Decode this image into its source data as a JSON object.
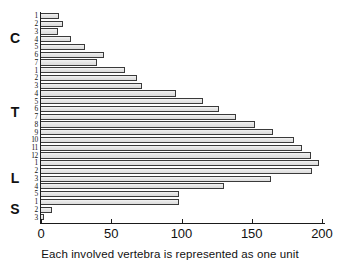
{
  "chart_data": {
    "type": "bar",
    "orientation": "horizontal",
    "title": "",
    "subtitle": "",
    "xlabel": "",
    "ylabel": "",
    "caption": "Each involved vertebra is represented as one unit",
    "xlim": [
      0,
      200
    ],
    "ylim": null,
    "grid": false,
    "legend": null,
    "xticks": [
      0,
      50,
      100,
      150,
      200
    ],
    "xtick_labels": [
      "0",
      "50",
      "100",
      "150",
      "200"
    ],
    "categories": [
      "C1",
      "C2",
      "C3",
      "C4",
      "C5",
      "C6",
      "C7",
      "T1",
      "T2",
      "T3",
      "T4",
      "T5",
      "T6",
      "T7",
      "T8",
      "T9",
      "T10",
      "T11",
      "T12",
      "L1",
      "L2",
      "L3",
      "L4",
      "L5",
      "S1",
      "S2",
      "S3"
    ],
    "tick_labels": [
      "1",
      "2",
      "3",
      "4",
      "5",
      "6",
      "7",
      "1",
      "2",
      "3",
      "4",
      "5",
      "6",
      "7",
      "8",
      "9",
      "10",
      "11",
      "12",
      "1",
      "2",
      "3",
      "4",
      "5",
      "1",
      "2",
      "3"
    ],
    "values": [
      13,
      16,
      12,
      21,
      31,
      45,
      40,
      60,
      68,
      72,
      96,
      115,
      127,
      139,
      152,
      165,
      180,
      186,
      192,
      198,
      193,
      164,
      130,
      98,
      98,
      8,
      2
    ],
    "region_groups": [
      {
        "letter": "C",
        "label": "Cervical",
        "start_index": 0,
        "count": 7
      },
      {
        "letter": "T",
        "label": "Thoracic",
        "start_index": 7,
        "count": 12
      },
      {
        "letter": "L",
        "label": "Lumbar",
        "start_index": 19,
        "count": 5
      },
      {
        "letter": "S",
        "label": "Sacral",
        "start_index": 24,
        "count": 3
      }
    ],
    "colors": {
      "bar_fill": "#e4e4e4",
      "bar_border": "#3a3a3a",
      "axis": "#1a1a1a",
      "text": "#111111",
      "background": "#ffffff"
    }
  }
}
